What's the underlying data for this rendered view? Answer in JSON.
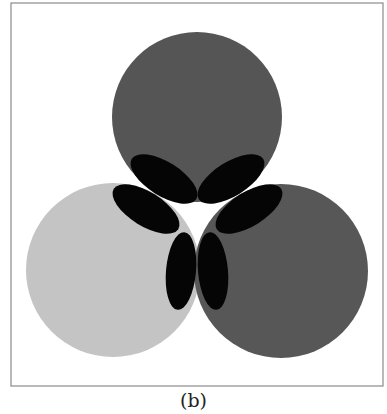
{
  "figure": {
    "caption": "(b)",
    "frame": {
      "x": 11,
      "y": 3,
      "width": 372,
      "height": 383,
      "stroke": "#8a8a8a"
    },
    "circles": [
      {
        "name": "top-circle",
        "cx": 197,
        "cy": 117,
        "r": 85,
        "fill": "#555555"
      },
      {
        "name": "left-circle",
        "cx": 113,
        "cy": 270,
        "r": 87,
        "fill": "#c4c4c4"
      },
      {
        "name": "right-circle",
        "cx": 281,
        "cy": 271,
        "r": 87,
        "fill": "#575757"
      }
    ],
    "ellipses": [
      {
        "name": "ellipse-upper-left",
        "cx": 164,
        "cy": 179,
        "rx": 38,
        "ry": 17,
        "rotate": 32
      },
      {
        "name": "ellipse-upper-right",
        "cx": 231,
        "cy": 179,
        "rx": 38,
        "ry": 17,
        "rotate": -32
      },
      {
        "name": "ellipse-mid-left",
        "cx": 146,
        "cy": 209,
        "rx": 38,
        "ry": 17,
        "rotate": 32
      },
      {
        "name": "ellipse-mid-right",
        "cx": 249,
        "cy": 209,
        "rx": 38,
        "ry": 17,
        "rotate": -32
      },
      {
        "name": "ellipse-bottom-left",
        "cx": 181,
        "cy": 271,
        "rx": 15,
        "ry": 39,
        "rotate": 5
      },
      {
        "name": "ellipse-bottom-right",
        "cx": 213,
        "cy": 271,
        "rx": 15,
        "ry": 39,
        "rotate": -5
      }
    ],
    "ellipse_fill": "#050505"
  }
}
